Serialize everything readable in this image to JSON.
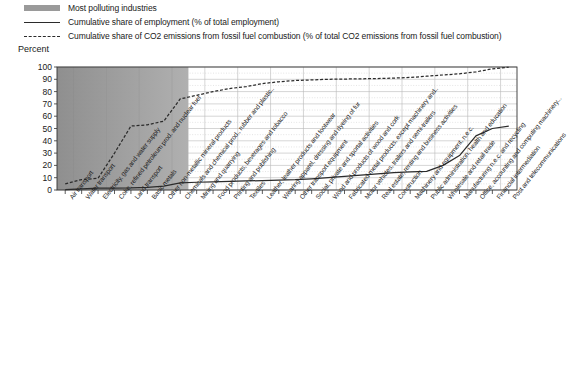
{
  "legend": {
    "items": [
      {
        "key": "shaded-band",
        "label": "Most polluting industries"
      },
      {
        "key": "solid-line",
        "label": "Cumulative share of employment (% of total employment)"
      },
      {
        "key": "dashed-line",
        "label": "Cumulative share of CO2 emissions from fossil fuel combustion (% of total CO2 emissions from fossil fuel combustion)"
      }
    ]
  },
  "axis": {
    "y_title": "Percent",
    "y_ticks": [
      "0",
      "10",
      "20",
      "30",
      "40",
      "50",
      "60",
      "70",
      "80",
      "90",
      "100"
    ]
  },
  "colors": {
    "band": "#9a9a9a",
    "line": "#2b2b2b",
    "grid": "#b9b9b9",
    "axis": "#333333",
    "background": "#ffffff"
  },
  "footnote": "",
  "chart_data": {
    "type": "line",
    "title": "",
    "xlabel": "",
    "ylabel": "Percent",
    "ylim": [
      0,
      100
    ],
    "grid": true,
    "legend_position": "top-left",
    "shaded_region": {
      "label": "Most polluting industries",
      "from_category_index": 0,
      "to_category_index": 7,
      "color": "#9a9a9a"
    },
    "categories": [
      "Air transport",
      "Water transport",
      "Electricity, gas and water supply",
      "Coke, refined petroleum prod. and nuclear fuel",
      "Land transport",
      "Basic metals",
      "Other non-metallic mineral products",
      "Chemicals and chemical prod., rubber and plastic..",
      "Mining and quarrying",
      "Food products, beverages and tobacco",
      "Printing and publishing",
      "Textiles",
      "Leather, leather products and footwear",
      "Wearing apparel, dressing and dyeing of fur",
      "Other transport equipment",
      "Social, private and sportal activities",
      "Wood and products of wood and cork",
      "Fabricated metal products, except machinery and..",
      "Motor vehicles, trailers and semi-trailers",
      "Real estate, renting and business activities",
      "Construction",
      "Machinery and equipment, n.e.c.",
      "Public administration, health and education",
      "Wholesale and retail trade",
      "Manufacturing n.e.c. and recycling",
      "Office, accounting and computing machinery...",
      "Financial intermediation",
      "Post and telecommunications"
    ],
    "series": [
      {
        "name": "Cumulative share of employment (% of total employment)",
        "style": "solid",
        "values": [
          0.4,
          0.9,
          1.5,
          1.6,
          1.7,
          2.2,
          3.2,
          5.8,
          6.3,
          6.6,
          7.0,
          7.4,
          7.6,
          8.0,
          8.4,
          9.1,
          10.0,
          11.0,
          12.0,
          13.2,
          14.2,
          14.8,
          15.2,
          20.0,
          28.0,
          44.0,
          50.0,
          52.0
        ]
      },
      {
        "name": "Cumulative share of CO2 emissions from fossil fuel combustion (% of total CO2 emissions from fossil fuel combustion)",
        "style": "dashed",
        "values": [
          5.0,
          8.5,
          9.5,
          30.0,
          52.0,
          53.0,
          56.0,
          74.0,
          77.0,
          80.0,
          82.5,
          84.0,
          86.5,
          88.0,
          89.0,
          89.5,
          90.0,
          90.2,
          90.4,
          90.6,
          91.0,
          91.5,
          92.5,
          93.5,
          94.5,
          96.0,
          98.5,
          99.8
        ]
      }
    ]
  }
}
